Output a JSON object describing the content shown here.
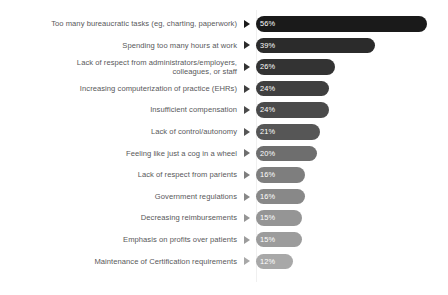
{
  "chart_data": {
    "type": "bar",
    "orientation": "horizontal",
    "title": "",
    "subtitle": "",
    "xlabel": "",
    "ylabel": "",
    "grid": false,
    "legend": "none",
    "xlim": [
      0,
      60
    ],
    "value_suffix": "%",
    "categories": [
      "Too many bureaucratic tasks (eg, charting, paperwork)",
      "Spending too many hours at work",
      "Lack of respect from administrators/employers,\ncolleagues, or staff",
      "Increasing computerization of practice (EHRs)",
      "Insufficient compensation",
      "Lack of control/autonomy",
      "Feeling like just a cog in a wheel",
      "Lack of respect from parients",
      "Government regulations",
      "Decreasing reimbursements",
      "Emphasis on profits over patients",
      "Maintenance of Certification requirements"
    ],
    "values": [
      56,
      39,
      26,
      24,
      24,
      21,
      20,
      16,
      16,
      15,
      15,
      12
    ],
    "value_labels": [
      "56%",
      "39%",
      "26%",
      "24%",
      "24%",
      "21%",
      "20%",
      "16%",
      "16%",
      "15%",
      "15%",
      "12%"
    ],
    "bar_colors": [
      "#1a1a1a",
      "#2b2b2b",
      "#333333",
      "#3f3f3f",
      "#4a4a4a",
      "#565656",
      "#6e6e6e",
      "#7e7e7e",
      "#888888",
      "#959595",
      "#9c9c9c",
      "#a8a8a8"
    ],
    "marker_colors": [
      "#1a1a1a",
      "#2b2b2b",
      "#333333",
      "#3f3f3f",
      "#4a4a4a",
      "#565656",
      "#6e6e6e",
      "#7e7e7e",
      "#888888",
      "#959595",
      "#9c9c9c",
      "#a8a8a8"
    ]
  },
  "style": {
    "background": "#ffffff",
    "label_color": "#58585a",
    "value_color": "#ffffff",
    "baseline_color": "#f0f0f0",
    "px_per_percent": 3.05
  }
}
